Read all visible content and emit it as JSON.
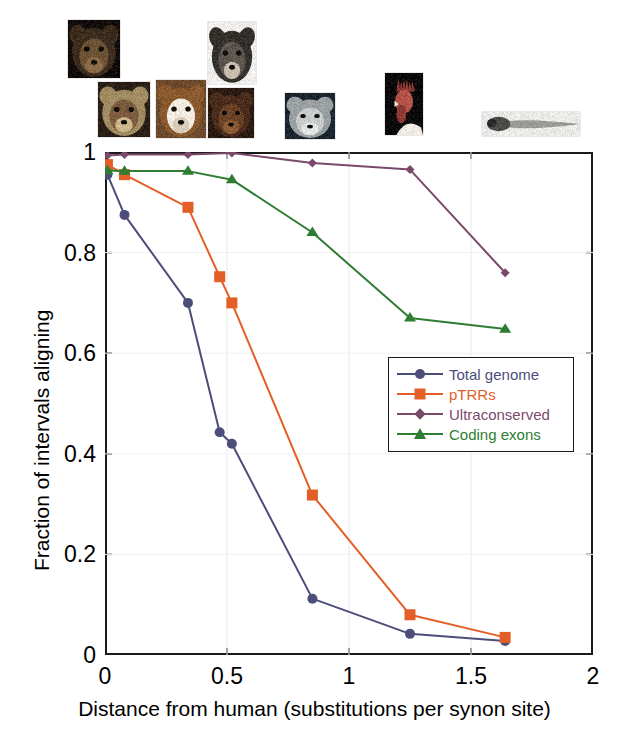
{
  "figure": {
    "title": "",
    "background": "#ffffff"
  },
  "axes": {
    "xlabel": "Distance from human (substitutions per synon site)",
    "ylabel": "Fraction of intervals aligning",
    "x_ticks": [
      "0",
      "0.5",
      "1",
      "1.5",
      "2"
    ],
    "y_ticks": [
      "0",
      "0.2",
      "0.4",
      "0.6",
      "0.8",
      "1"
    ],
    "xlim": [
      0,
      2
    ],
    "ylim": [
      0,
      1
    ],
    "frame_color": "#1a1a1a"
  },
  "legend": {
    "position": "center-right",
    "entries": [
      {
        "label": "Total genome",
        "color": "#4d4d7a",
        "marker": "circle"
      },
      {
        "label": "pTRRs",
        "color": "#e35f27",
        "marker": "square"
      },
      {
        "label": "Ultraconserved",
        "color": "#7a4a6b",
        "marker": "diamond"
      },
      {
        "label": "Coding exons",
        "color": "#2e7d32",
        "marker": "triangle"
      }
    ]
  },
  "species_images": [
    {
      "name": "chimpanzee",
      "x": 68,
      "y": 20,
      "w": 52,
      "h": 58
    },
    {
      "name": "macaque",
      "x": 98,
      "y": 82,
      "w": 52,
      "h": 55
    },
    {
      "name": "dog",
      "x": 156,
      "y": 80,
      "w": 50,
      "h": 58
    },
    {
      "name": "mouse",
      "x": 208,
      "y": 22,
      "w": 48,
      "h": 62
    },
    {
      "name": "rat",
      "x": 208,
      "y": 88,
      "w": 46,
      "h": 50
    },
    {
      "name": "opossum",
      "x": 285,
      "y": 93,
      "w": 50,
      "h": 46
    },
    {
      "name": "chicken",
      "x": 385,
      "y": 73,
      "w": 38,
      "h": 62
    },
    {
      "name": "zebrafish",
      "x": 482,
      "y": 112,
      "w": 98,
      "h": 24
    }
  ],
  "chart_data": {
    "type": "line",
    "title": "",
    "xlabel": "Distance from human (substitutions per synon site)",
    "ylabel": "Fraction of intervals aligning",
    "xlim": [
      0,
      2
    ],
    "ylim": [
      0,
      1
    ],
    "grid": false,
    "legend_position": "center-right",
    "series": [
      {
        "name": "Total genome",
        "color": "#4d4d7a",
        "marker": "circle",
        "points": [
          [
            0.01,
            0.955
          ],
          [
            0.08,
            0.875
          ],
          [
            0.34,
            0.7
          ],
          [
            0.47,
            0.443
          ],
          [
            0.52,
            0.42
          ],
          [
            0.85,
            0.112
          ],
          [
            1.25,
            0.042
          ],
          [
            1.64,
            0.028
          ]
        ]
      },
      {
        "name": "pTRRs",
        "color": "#e35f27",
        "marker": "square",
        "points": [
          [
            0.01,
            0.975
          ],
          [
            0.08,
            0.955
          ],
          [
            0.34,
            0.89
          ],
          [
            0.47,
            0.752
          ],
          [
            0.52,
            0.7
          ],
          [
            0.85,
            0.318
          ],
          [
            1.25,
            0.08
          ],
          [
            1.64,
            0.035
          ]
        ]
      },
      {
        "name": "Ultraconserved",
        "color": "#7a4a6b",
        "marker": "diamond",
        "points": [
          [
            0.01,
            0.993
          ],
          [
            0.08,
            0.995
          ],
          [
            0.34,
            0.995
          ],
          [
            0.52,
            0.998
          ],
          [
            0.85,
            0.978
          ],
          [
            1.25,
            0.965
          ],
          [
            1.64,
            0.76
          ]
        ]
      },
      {
        "name": "Coding exons",
        "color": "#2e7d32",
        "marker": "triangle",
        "points": [
          [
            0.01,
            0.963
          ],
          [
            0.08,
            0.962
          ],
          [
            0.34,
            0.962
          ],
          [
            0.52,
            0.945
          ],
          [
            0.85,
            0.84
          ],
          [
            1.25,
            0.67
          ],
          [
            1.64,
            0.648
          ]
        ]
      }
    ]
  }
}
